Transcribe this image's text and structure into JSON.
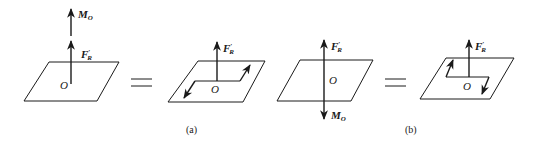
{
  "figure": {
    "panel_a": {
      "caption": "(a)",
      "left": {
        "moment_label": "M",
        "moment_sub": "O",
        "force_label": "F",
        "force_sup": "′",
        "force_sub": "R",
        "origin": "O"
      },
      "right": {
        "force_label": "F",
        "force_sup": "′",
        "force_sub": "R",
        "origin": "O"
      }
    },
    "panel_b": {
      "caption": "(b)",
      "left": {
        "moment_label": "M",
        "moment_sub": "O",
        "force_label": "F",
        "force_sup": "′",
        "force_sub": "R",
        "origin": "O"
      },
      "right": {
        "force_label": "F",
        "force_sup": "′",
        "force_sub": "R",
        "origin": "O"
      }
    },
    "equals": "="
  }
}
